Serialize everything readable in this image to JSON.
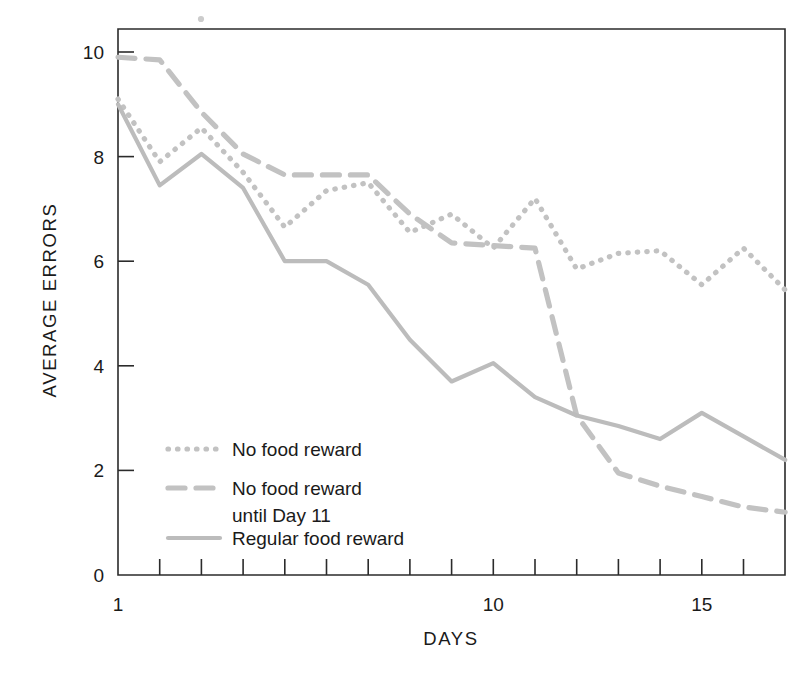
{
  "chart_data": {
    "type": "line",
    "title": "",
    "xlabel": "DAYS",
    "ylabel": "AVERAGE ERRORS",
    "xlim": [
      1,
      17
    ],
    "ylim": [
      0,
      10.5
    ],
    "grid": false,
    "legend_position": "inside-lower-left",
    "x_tick_values": [
      1,
      2,
      3,
      4,
      5,
      6,
      7,
      8,
      9,
      10,
      11,
      12,
      13,
      14,
      15,
      16,
      17
    ],
    "x_tick_labels": [
      "1",
      "",
      "",
      "",
      "",
      "",
      "",
      "",
      "",
      "10",
      "",
      "",
      "",
      "",
      "15",
      "",
      ""
    ],
    "y_tick_values": [
      0,
      2,
      4,
      6,
      8,
      10
    ],
    "y_tick_labels": [
      "0",
      "2",
      "4",
      "6",
      "8",
      "10"
    ],
    "x": [
      1,
      2,
      3,
      4,
      5,
      6,
      7,
      8,
      9,
      10,
      11,
      12,
      13,
      14,
      15,
      16,
      17
    ],
    "series": [
      {
        "name": "No food reward",
        "style": "dotted",
        "color": "#c2c2c2",
        "values": [
          9.1,
          7.9,
          8.55,
          7.7,
          6.65,
          7.35,
          7.5,
          6.55,
          6.9,
          6.25,
          7.2,
          5.85,
          6.15,
          6.2,
          5.55,
          6.25,
          5.45
        ]
      },
      {
        "name": "No food reward until Day 11",
        "style": "dashed",
        "color": "#c2c2c2",
        "values": [
          9.9,
          9.85,
          8.85,
          8.05,
          7.65,
          7.65,
          7.65,
          6.9,
          6.35,
          6.3,
          6.25,
          3.05,
          1.95,
          1.7,
          1.5,
          1.3,
          1.2
        ]
      },
      {
        "name": "Regular food reward",
        "style": "solid",
        "color": "#bcbcbc",
        "values": [
          9.0,
          7.45,
          8.05,
          7.4,
          6.0,
          6.0,
          5.55,
          4.5,
          3.7,
          4.05,
          3.4,
          3.05,
          2.85,
          2.6,
          3.1,
          2.65,
          2.2
        ]
      }
    ]
  },
  "legend": {
    "items": [
      {
        "label": "No food reward",
        "label2": "",
        "style": "dotted"
      },
      {
        "label": "No food reward",
        "label2": "until Day 11",
        "style": "dashed"
      },
      {
        "label": "Regular food reward",
        "label2": "",
        "style": "solid"
      }
    ]
  }
}
